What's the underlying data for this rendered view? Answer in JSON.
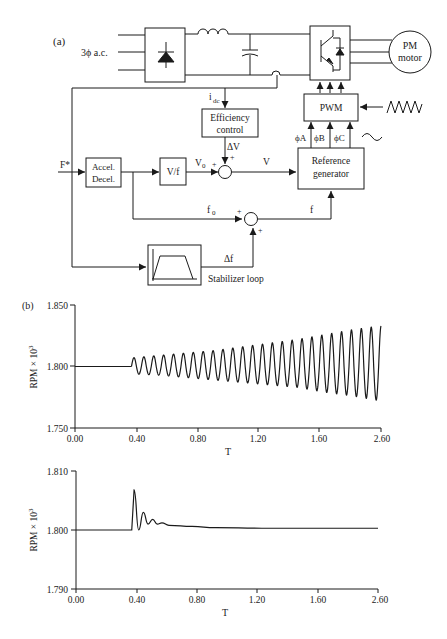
{
  "figure": {
    "panel_a_label": "(a)",
    "panel_b_label": "(b)"
  },
  "diagram": {
    "supply_label": "3ϕ a.c.",
    "motor_label_line1": "PM",
    "motor_label_line2": "motor",
    "pwm_label": "PWM",
    "efficiency_line1": "Efficiency",
    "efficiency_line2": "control",
    "idc_label": "i",
    "idc_sub": "dc",
    "delta_v_label": "ΔV",
    "phase_a": "ϕA",
    "phase_b": "ϕB",
    "phase_c": "ϕC",
    "ref_gen_line1": "Reference",
    "ref_gen_line2": "generator",
    "fstar_label": "F*",
    "accel_line1": "Accel.",
    "accel_line2": "Decel.",
    "vf_label": "V/f",
    "v0_label": "V",
    "v0_sub": "0",
    "v_label": "V",
    "f0_label": "f",
    "f0_sub": "0",
    "f_label": "f",
    "delta_f_label": "Δf",
    "stabilizer_label": "Stabilizer loop",
    "plus": "+"
  },
  "chart_data": [
    {
      "type": "line",
      "title": "",
      "xlabel": "T",
      "ylabel": "RPM × 10",
      "ylabel_sup": "3",
      "xlim": [
        0.0,
        2.6
      ],
      "ylim": [
        1.75,
        1.85
      ],
      "x_ticks": [
        "0.00",
        "0.40",
        "0.80",
        "1.20",
        "1.60",
        "2.60"
      ],
      "y_ticks": [
        "1.750",
        "1.800",
        "1.850"
      ],
      "grid": false,
      "description": "Flat at 1.800 until T≈0.48, then sustained oscillation with growing amplitude (without stabilizer)",
      "series": [
        {
          "name": "speed_unstabilized",
          "x": [
            0.0,
            0.48,
            0.52,
            0.56,
            0.74,
            0.9,
            1.06,
            1.22,
            1.38,
            1.54,
            1.7,
            1.86,
            2.02,
            2.18,
            2.34,
            2.5,
            2.6
          ],
          "y": [
            1.8,
            1.8,
            1.807,
            1.794,
            1.809,
            1.791,
            1.811,
            1.789,
            1.812,
            1.787,
            1.816,
            1.785,
            1.82,
            1.782,
            1.824,
            1.776,
            1.795
          ],
          "envelope_upper": [
            1.807,
            1.809,
            1.811,
            1.813,
            1.816,
            1.819,
            1.822,
            1.826,
            1.83,
            1.833
          ],
          "envelope_lower": [
            1.794,
            1.793,
            1.791,
            1.789,
            1.787,
            1.785,
            1.783,
            1.779,
            1.776,
            1.772
          ],
          "oscillation_period": 0.084
        }
      ]
    },
    {
      "type": "line",
      "title": "",
      "xlabel": "T",
      "ylabel": "RPM × 10",
      "ylabel_sup": "3",
      "xlim": [
        0.0,
        2.6
      ],
      "ylim": [
        1.79,
        1.81
      ],
      "x_ticks": [
        "0.00",
        "0.40",
        "0.80",
        "1.20",
        "1.60",
        "2.60"
      ],
      "y_ticks": [
        "1.790",
        "1.800",
        "1.810"
      ],
      "grid": false,
      "description": "Flat at 1.800 until T≈0.48, damped oscillation settling to ≈1.8003 (with stabilizer loop)",
      "series": [
        {
          "name": "speed_stabilized",
          "x": [
            0.0,
            0.48,
            0.5,
            0.54,
            0.58,
            0.62,
            0.66,
            0.7,
            0.74,
            0.8,
            1.0,
            1.2,
            1.6,
            2.0,
            2.6
          ],
          "y": [
            1.8,
            1.8,
            1.8068,
            1.8,
            1.803,
            1.801,
            1.8018,
            1.801,
            1.8012,
            1.8008,
            1.8006,
            1.8004,
            1.8003,
            1.8003,
            1.8003
          ]
        }
      ]
    }
  ]
}
